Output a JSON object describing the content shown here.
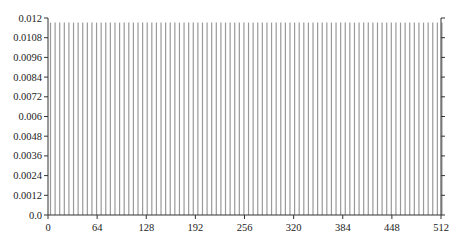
{
  "chart_data": {
    "type": "bar",
    "title": "",
    "xlabel": "",
    "ylabel": "",
    "xlim": [
      0,
      512
    ],
    "ylim": [
      0,
      0.012
    ],
    "x_ticks": [
      0,
      64,
      128,
      192,
      256,
      320,
      384,
      448,
      512
    ],
    "x_tick_labels": [
      "0",
      "64",
      "128",
      "192",
      "256",
      "320",
      "384",
      "448",
      "512"
    ],
    "y_ticks": [
      0,
      0.0012,
      0.0024,
      0.0036,
      0.0048,
      0.006,
      0.0072,
      0.0084,
      0.0096,
      0.0108,
      0.012
    ],
    "y_tick_labels": [
      "0.0",
      "0.0012",
      "0.0024",
      "0.0036",
      "0.0048",
      "0.006",
      "0.0072",
      "0.0084",
      "0.0096",
      "0.0108",
      "0.012"
    ],
    "grid": false,
    "legend": null,
    "bar_step": 6,
    "bar_value": 0.01172,
    "series": [
      {
        "name": "distribution",
        "x_start": 0,
        "x_step": 6,
        "count": 86,
        "value_each": 0.01172
      }
    ],
    "colors": {
      "bar": "#9a9a9a",
      "axis": "#333333"
    }
  }
}
